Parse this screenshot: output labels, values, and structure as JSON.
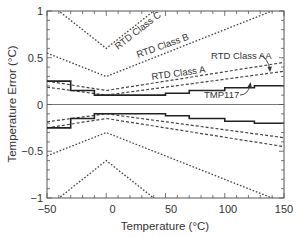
{
  "chart_data": {
    "type": "line",
    "title": "",
    "xlabel": "Temperature (°C)",
    "ylabel": "Temperature Error (°C)",
    "xlim": [
      -50,
      150
    ],
    "ylim": [
      -1,
      1
    ],
    "xticks": [
      -50,
      0,
      50,
      100,
      150
    ],
    "xtick_labels": [
      "−50",
      "0",
      "50",
      "100",
      "150"
    ],
    "yticks": [
      -1,
      -0.5,
      0,
      0.5,
      1
    ],
    "ytick_labels": [
      "−1",
      "−0.5",
      "0",
      "0.5",
      "1"
    ],
    "grid": false,
    "legend": null,
    "series": [
      {
        "name": "RTD Class C",
        "style": "dotted",
        "symmetric": true,
        "x": [
          -50,
          0,
          150
        ],
        "y_upper": [
          1.1,
          0.6,
          2.1
        ]
      },
      {
        "name": "RTD Class B",
        "style": "dotted",
        "symmetric": true,
        "x": [
          -50,
          0,
          150
        ],
        "y_upper": [
          0.55,
          0.3,
          1.05
        ]
      },
      {
        "name": "RTD Class A",
        "style": "dashed",
        "symmetric": true,
        "x": [
          -50,
          0,
          150
        ],
        "y_upper": [
          0.25,
          0.15,
          0.45
        ]
      },
      {
        "name": "RTD Class AA",
        "style": "dashed",
        "symmetric": true,
        "x": [
          -50,
          0,
          150
        ],
        "y_upper": [
          0.185,
          0.1,
          0.355
        ]
      },
      {
        "name": "TMP117",
        "style": "solid-step",
        "symmetric": true,
        "x": [
          -50,
          -30,
          -30,
          -10,
          -10,
          50,
          50,
          70,
          70,
          100,
          100,
          125,
          125,
          150
        ],
        "y_upper": [
          0.25,
          0.25,
          0.15,
          0.15,
          0.1,
          0.1,
          0.12,
          0.12,
          0.15,
          0.15,
          0.18,
          0.18,
          0.2,
          0.2
        ]
      }
    ],
    "zero_line": true,
    "annotations": [
      {
        "text": "RTD Class C",
        "x": 10,
        "y": 0.72,
        "rotation": -38
      },
      {
        "text": "RTD Class B",
        "x": 30,
        "y": 0.5,
        "rotation": -20
      },
      {
        "text": "RTD Class A",
        "x": 30,
        "y": 0.24,
        "rotation": -8
      },
      {
        "text": "RTD Class AA",
        "x": 120,
        "y": 0.44,
        "arrow_to": [
          140,
          0.33
        ]
      },
      {
        "text": "TMP117",
        "x": 90,
        "y": 0.07,
        "arrow_to": [
          118,
          0.14
        ]
      }
    ]
  },
  "labels": {
    "xlabel": "Temperature (°C)",
    "ylabel": "Temperature Error (°C)",
    "class_c": "RTD Class C",
    "class_b": "RTD Class B",
    "class_a": "RTD Class A",
    "class_aa": "RTD Class AA",
    "tmp117": "TMP117",
    "xt0": "−50",
    "xt1": "0",
    "xt2": "50",
    "xt3": "100",
    "xt4": "150",
    "yt0": "1",
    "yt1": "0.5",
    "yt2": "0",
    "yt3": "−0.5",
    "yt4": "−1"
  }
}
